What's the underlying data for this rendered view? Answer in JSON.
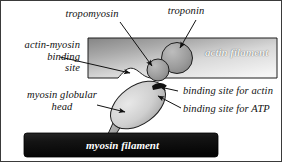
{
  "diagram": {
    "labels": {
      "tropomyosin": "tropomyosin",
      "troponin": "troponin",
      "actin_myosin_binding_site_line1": "actin-myosin",
      "actin_myosin_binding_site_line2": "binding",
      "actin_myosin_binding_site_line3": "site",
      "myosin_globular_head_line1": "myosin globular",
      "myosin_globular_head_line2": "head",
      "binding_site_for_actin": "binding site for actin",
      "binding_site_for_atp": "binding site for ATP",
      "actin_filament": "actin filament",
      "myosin_filament": "myosin filament"
    },
    "colors": {
      "background": "#ffffff",
      "frame_border": "#3a3a3a",
      "actin_filament_dark": "#8d8d8d",
      "actin_filament_light": "#f2f2f2",
      "myosin_filament_dark": "#111111",
      "structure_outline": "#1a1a1a",
      "circle_fill": "#9a9a9a",
      "head_fill": "#c9c9c9",
      "text": "#111111",
      "bar_text": "#ffffff"
    },
    "shapes": {
      "actin_filament_label": "actin filament",
      "myosin_filament_label": "myosin filament",
      "troponin_shape": "large-circle",
      "tropomyosin_shape": "small-circle",
      "myosin_head_shape": "tilted-ellipse",
      "binding_notch_shape": "bump-notch"
    }
  }
}
